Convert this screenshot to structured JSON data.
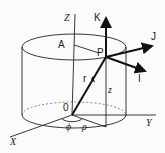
{
  "diagram": {
    "labels": {
      "z_axis": "Z",
      "x_axis": "X",
      "y_axis": "Y",
      "origin": "0",
      "point_a": "A",
      "point_p": "P",
      "unit_k": "K",
      "unit_j": "J",
      "unit_i": "I",
      "radius_vector": "r",
      "height": "z",
      "azimuth": "ϕ",
      "radial_distance": "ρ"
    },
    "colors": {
      "ink": "#222222",
      "background": "#fbfbfb"
    }
  }
}
